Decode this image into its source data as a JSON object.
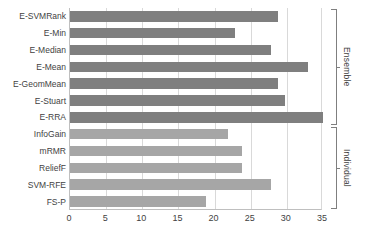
{
  "chart_data": {
    "type": "bar",
    "orientation": "horizontal",
    "title": "",
    "xlabel": "",
    "ylabel": "",
    "xlim": [
      0,
      35
    ],
    "xticks": [
      0,
      5,
      10,
      15,
      20,
      25,
      30,
      35
    ],
    "grid": true,
    "legend": "none",
    "categories": [
      "E-SVMRank",
      "E-Min",
      "E-Median",
      "E-Mean",
      "E-GeomMean",
      "E-Stuart",
      "E-RRA",
      "InfoGain",
      "mRMR",
      "ReliefF",
      "SVM-RFE",
      "FS-P"
    ],
    "values": [
      28.8,
      22.8,
      27.8,
      32.9,
      28.8,
      29.8,
      35.0,
      21.8,
      23.8,
      23.8,
      27.8,
      18.8
    ],
    "bar_colors": [
      "#7f7f7f",
      "#7f7f7f",
      "#7f7f7f",
      "#7f7f7f",
      "#7f7f7f",
      "#7f7f7f",
      "#7f7f7f",
      "#a6a6a6",
      "#a6a6a6",
      "#a6a6a6",
      "#a6a6a6",
      "#a6a6a6"
    ],
    "groups": [
      {
        "label": "Ensemble",
        "from": 0,
        "to": 6
      },
      {
        "label": "Individual",
        "from": 7,
        "to": 11
      }
    ]
  },
  "colors": {
    "ensemble_bar": "#7f7f7f",
    "individual_bar": "#a6a6a6",
    "gridline": "#d9d9d9",
    "axis": "#bfbfbf",
    "text": "#3f3f3f",
    "background": "#ffffff"
  }
}
